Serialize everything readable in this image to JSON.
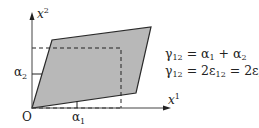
{
  "diagram": {
    "type": "shear-strain-deformation",
    "axes": {
      "x_label": "x",
      "x_label_sup": "1",
      "y_label": "x",
      "y_label_sup": "2",
      "origin_label": "O"
    },
    "angles": {
      "alpha1": {
        "base": "α",
        "sub": "1"
      },
      "alpha2": {
        "base": "α",
        "sub": "2"
      }
    },
    "equations": [
      {
        "lhs": "γ",
        "lhs_sub": "12",
        "rhs": "= α",
        "rhs_sub1": "1",
        "mid": " + α",
        "rhs_sub2": "2"
      },
      {
        "lhs": "γ",
        "lhs_sub": "12",
        "rhs": "= 2ε",
        "rhs_sub1": "12",
        "mid": " = 2ε",
        "rhs_sub2": "21"
      }
    ],
    "colors": {
      "fill": "#b8b8b8",
      "stroke": "#2a2a2a",
      "axis": "#444444"
    }
  }
}
